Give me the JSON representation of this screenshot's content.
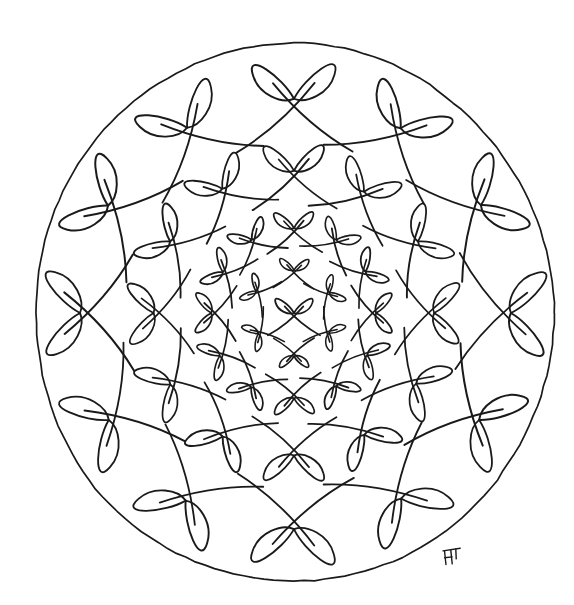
{
  "artwork": {
    "title": "Bow Mandala",
    "medium": "hand-drawn ink line art",
    "background_color": "#ffffff",
    "ink_color": "#1a1a1a",
    "canvas": {
      "width": 574,
      "height": 605
    }
  },
  "frame": {
    "shape": "circle",
    "name": "outer-border-circle",
    "center_x": 294,
    "center_y": 313,
    "radius_x": 259,
    "radius_y": 269,
    "stroke_width": 1.7
  },
  "motif": {
    "name": "bow-butterfly",
    "description": "two teardrop loops crossing at a point with two curved tails trailing outward",
    "loops": 2,
    "tails": 2
  },
  "rings": [
    {
      "name": "ring-outer",
      "index": 1,
      "count": 12,
      "radius": 215,
      "scale": 1.0,
      "angle_offset": 0,
      "loop_length": 52,
      "loop_width": 40,
      "tail_length": 62,
      "stroke_width": 1.9
    },
    {
      "name": "ring-second",
      "index": 2,
      "count": 12,
      "radius": 142,
      "scale": 0.72,
      "angle_offset": 0,
      "loop_length": 38,
      "loop_width": 29,
      "tail_length": 45,
      "stroke_width": 1.8
    },
    {
      "name": "ring-third",
      "index": 3,
      "count": 12,
      "radius": 84,
      "scale": 0.46,
      "angle_offset": 0,
      "loop_length": 24,
      "loop_width": 19,
      "tail_length": 29,
      "stroke_width": 1.7
    },
    {
      "name": "ring-inner",
      "index": 4,
      "count": 6,
      "radius": 42,
      "scale": 0.33,
      "angle_offset": 0,
      "loop_length": 17,
      "loop_width": 14,
      "tail_length": 21,
      "stroke_width": 1.6
    }
  ],
  "center_motif": {
    "name": "center-bow",
    "x": 294,
    "y": 313,
    "scale": 0.42,
    "loop_length": 22,
    "loop_width": 18,
    "tail_length": 26,
    "stroke_width": 1.7
  },
  "signature": {
    "name": "artist-monogram",
    "text": "AT",
    "x": 452,
    "y": 556,
    "rotation": -6,
    "font_size": 15,
    "stroke_width": 1.4
  }
}
